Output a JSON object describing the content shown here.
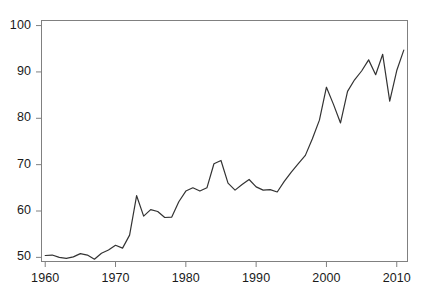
{
  "chart_data": {
    "type": "line",
    "title": "",
    "subtitle": "",
    "xlabel": "",
    "ylabel": "",
    "xlim": [
      1959.2,
      1962.0
    ],
    "ylim": [
      49.0,
      101.2
    ],
    "xticks": [
      1960,
      1970,
      1980,
      1990,
      2000,
      2010
    ],
    "xtick_labels": [
      "1960",
      "1970",
      "1980",
      "1990",
      "2000",
      "2010"
    ],
    "yticks": [
      50,
      60,
      70,
      80,
      90,
      100
    ],
    "ytick_labels": [
      "50",
      "60",
      "70",
      "80",
      "90",
      "100"
    ],
    "grid": false,
    "legend": null,
    "legend_position": "none",
    "line_color": "#333333",
    "line_width": 1.2,
    "axis_color": "#808080",
    "background_color": "#ffffff",
    "series": [
      {
        "name": "value",
        "x": [
          1960,
          1961,
          1962,
          1963,
          1964,
          1965,
          1966,
          1967,
          1968,
          1969,
          1970,
          1971,
          1972,
          1973,
          1974,
          1975,
          1976,
          1977,
          1978,
          1979,
          1980,
          1981,
          1982,
          1983,
          1984,
          1985,
          1986,
          1987,
          1988,
          1989,
          1990,
          1991,
          1992,
          1993,
          1994,
          1995,
          1996,
          1997,
          1998,
          1999,
          2000,
          2001,
          2002,
          2003,
          2004,
          2005,
          2006,
          2007,
          2008,
          2009,
          2010,
          2011
        ],
        "values": [
          50.4,
          50.5,
          50.0,
          49.8,
          50.1,
          50.8,
          50.5,
          49.6,
          50.9,
          51.6,
          52.6,
          52.0,
          54.8,
          63.3,
          58.9,
          60.3,
          59.9,
          58.6,
          58.7,
          62.0,
          64.3,
          65.0,
          64.3,
          65.0,
          70.2,
          70.9,
          66.0,
          64.5,
          65.7,
          66.8,
          65.2,
          64.5,
          64.6,
          64.1,
          66.4,
          68.4,
          70.2,
          72.0,
          75.6,
          79.6,
          86.7,
          83.0,
          79.0,
          85.8,
          88.3,
          90.2,
          92.6,
          89.4,
          93.8,
          83.7,
          90.3,
          94.7
        ]
      }
    ]
  },
  "plot_geometry": {
    "left": 41,
    "right": 408,
    "top": 20,
    "bottom": 262,
    "tick_length": 5
  }
}
